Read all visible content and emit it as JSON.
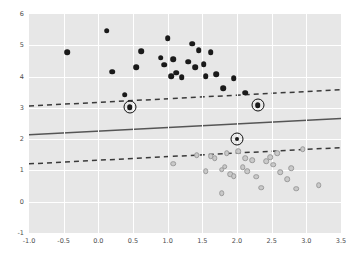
{
  "chart_data": {
    "type": "scatter",
    "title": "",
    "xlabel": "",
    "ylabel": "",
    "xlim": [
      -1.0,
      3.5
    ],
    "ylim": [
      -1,
      6
    ],
    "grid": true,
    "legend": "none",
    "xticks": [
      "-1.0",
      "-0.5",
      "0.0",
      "0.5",
      "1.0",
      "1.5",
      "2.0",
      "2.5",
      "3.0",
      "3.5"
    ],
    "xtick_values": [
      -1.0,
      -0.5,
      0.0,
      0.5,
      1.0,
      1.5,
      2.0,
      2.5,
      3.0,
      3.5
    ],
    "yticks": [
      "-1",
      "0",
      "1",
      "2",
      "3",
      "4",
      "5",
      "6"
    ],
    "ytick_values": [
      -1,
      0,
      1,
      2,
      3,
      4,
      5,
      6
    ],
    "series": [
      {
        "name": "class-positive",
        "marker": "filled-circle",
        "color": "#1a1a1a",
        "points": [
          [
            -0.45,
            4.78
          ],
          [
            0.12,
            5.47
          ],
          [
            0.2,
            4.15
          ],
          [
            0.55,
            4.3
          ],
          [
            0.62,
            4.82
          ],
          [
            0.9,
            4.6
          ],
          [
            0.95,
            4.38
          ],
          [
            1.0,
            5.22
          ],
          [
            1.05,
            4.02
          ],
          [
            1.08,
            4.55
          ],
          [
            1.12,
            4.12
          ],
          [
            1.2,
            3.98
          ],
          [
            1.3,
            4.48
          ],
          [
            1.35,
            5.05
          ],
          [
            1.4,
            4.3
          ],
          [
            1.45,
            4.85
          ],
          [
            1.52,
            4.4
          ],
          [
            1.55,
            4.02
          ],
          [
            1.62,
            4.78
          ],
          [
            1.7,
            4.08
          ],
          [
            1.8,
            3.62
          ],
          [
            1.95,
            3.95
          ],
          [
            0.38,
            3.42
          ],
          [
            2.12,
            3.48
          ],
          [
            2.3,
            3.08
          ],
          [
            0.45,
            3.02
          ]
        ]
      },
      {
        "name": "class-negative",
        "marker": "open-circle",
        "color": "#c9c9c9",
        "points": [
          [
            1.08,
            1.22
          ],
          [
            1.42,
            1.48
          ],
          [
            1.55,
            0.98
          ],
          [
            1.62,
            1.45
          ],
          [
            1.68,
            1.4
          ],
          [
            1.78,
            1.02
          ],
          [
            1.82,
            1.12
          ],
          [
            1.85,
            1.55
          ],
          [
            1.9,
            0.88
          ],
          [
            1.95,
            0.82
          ],
          [
            2.02,
            1.62
          ],
          [
            2.08,
            1.1
          ],
          [
            2.12,
            1.4
          ],
          [
            2.15,
            0.98
          ],
          [
            2.22,
            1.32
          ],
          [
            2.28,
            0.8
          ],
          [
            2.35,
            0.45
          ],
          [
            2.42,
            1.3
          ],
          [
            2.48,
            1.42
          ],
          [
            2.52,
            1.18
          ],
          [
            2.58,
            1.55
          ],
          [
            2.62,
            0.95
          ],
          [
            2.72,
            0.72
          ],
          [
            2.78,
            1.08
          ],
          [
            2.85,
            0.42
          ],
          [
            2.95,
            1.68
          ],
          [
            3.18,
            0.52
          ],
          [
            1.78,
            0.28
          ]
        ]
      }
    ],
    "support_vectors": [
      [
        0.45,
        3.02
      ],
      [
        2.3,
        3.08
      ],
      [
        2.0,
        2.02
      ]
    ],
    "lines": [
      {
        "name": "decision-boundary",
        "style": "solid",
        "color": "#555555",
        "x0": -1.0,
        "y0": 2.14,
        "x1": 3.5,
        "y1": 2.66
      },
      {
        "name": "upper-margin",
        "style": "dashed",
        "color": "#3a3a3a",
        "x0": -1.0,
        "y0": 3.06,
        "x1": 3.5,
        "y1": 3.58
      },
      {
        "name": "lower-margin",
        "style": "dashed",
        "color": "#3a3a3a",
        "x0": -1.0,
        "y0": 1.21,
        "x1": 3.5,
        "y1": 1.73
      }
    ]
  }
}
